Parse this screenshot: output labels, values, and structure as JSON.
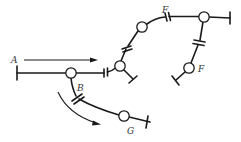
{
  "diagram": {
    "type": "molecular-network-schematic",
    "labels": {
      "A": "A",
      "B": "B",
      "F_top": "F",
      "F_right": "F",
      "G": "G"
    },
    "colors": {
      "stroke": "#1a1a1a",
      "background": "#ffffff",
      "label": "#333333"
    },
    "nodes": [
      {
        "id": "junction-main",
        "x": 71,
        "y": 73
      },
      {
        "id": "junction-upper",
        "x": 120,
        "y": 66
      },
      {
        "id": "node-F-top",
        "x": 142,
        "y": 27,
        "label": "F"
      },
      {
        "id": "junction-top-right",
        "x": 204,
        "y": 17
      },
      {
        "id": "node-F-right",
        "x": 189,
        "y": 68,
        "label": "F"
      },
      {
        "id": "node-G",
        "x": 124,
        "y": 116,
        "label": "G"
      }
    ],
    "arrows": [
      {
        "id": "arrow-A",
        "label": "A",
        "kind": "straight"
      },
      {
        "id": "arrow-B",
        "label": "",
        "kind": "curved"
      }
    ]
  }
}
